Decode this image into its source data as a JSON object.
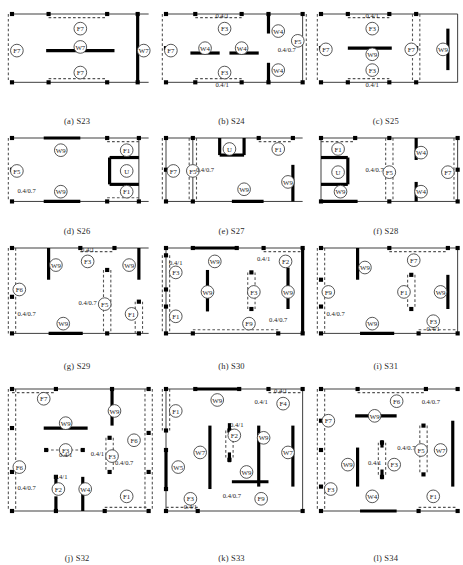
{
  "figure": {
    "type": "diagram",
    "panel_count": 12,
    "rows": 4,
    "cols": 3,
    "colors": {
      "outline": "#3a3a3a",
      "solid_wall": "#000000",
      "dashed_wall": "#555555",
      "node": "#000000",
      "label_text": "#1a1a1a"
    }
  },
  "panels": [
    {
      "id": "S23",
      "caption": "(a) S23",
      "plan": {
        "w": 112,
        "h": 56
      },
      "labels": [
        {
          "text": "F7",
          "x": 56,
          "y": 12,
          "shape": "circle"
        },
        {
          "text": "W7",
          "x": 56,
          "y": 27,
          "shape": "circle"
        },
        {
          "text": "F7",
          "x": 56,
          "y": 48,
          "shape": "circle"
        },
        {
          "text": "F7",
          "x": 4,
          "y": 30,
          "shape": "circle"
        },
        {
          "text": "W7",
          "x": 108,
          "y": 30,
          "shape": "circle"
        }
      ],
      "dims": []
    },
    {
      "id": "S24",
      "caption": "(b) S24",
      "plan": {
        "w": 112,
        "h": 56
      },
      "labels": [
        {
          "text": "F3",
          "x": 48,
          "y": 12,
          "shape": "circle"
        },
        {
          "text": "F3",
          "x": 48,
          "y": 48,
          "shape": "circle"
        },
        {
          "text": "W4",
          "x": 32,
          "y": 28,
          "shape": "circle"
        },
        {
          "text": "W4",
          "x": 62,
          "y": 28,
          "shape": "circle"
        },
        {
          "text": "F7",
          "x": 4,
          "y": 30,
          "shape": "circle"
        },
        {
          "text": "W4",
          "x": 92,
          "y": 14,
          "shape": "circle"
        },
        {
          "text": "W4",
          "x": 92,
          "y": 46,
          "shape": "circle"
        },
        {
          "text": "F5",
          "x": 108,
          "y": 22,
          "shape": "circle"
        }
      ],
      "dims": [
        {
          "text": "0.4/1",
          "x": 46,
          "y": 3
        },
        {
          "text": "0.4/1",
          "x": 46,
          "y": 60
        },
        {
          "text": "0.4/0.7",
          "x": 99,
          "y": 31
        }
      ]
    },
    {
      "id": "S25",
      "caption": "(c) S25",
      "plan": {
        "w": 112,
        "h": 56
      },
      "labels": [
        {
          "text": "F3",
          "x": 42,
          "y": 12,
          "shape": "circle"
        },
        {
          "text": "W9",
          "x": 42,
          "y": 33,
          "shape": "circle"
        },
        {
          "text": "F3",
          "x": 42,
          "y": 46,
          "shape": "circle"
        },
        {
          "text": "F7",
          "x": 4,
          "y": 29,
          "shape": "circle"
        },
        {
          "text": "F7",
          "x": 74,
          "y": 29,
          "shape": "circle"
        },
        {
          "text": "W9",
          "x": 100,
          "y": 29,
          "shape": "circle"
        }
      ],
      "dims": [
        {
          "text": "0.4/1",
          "x": 42,
          "y": 3
        },
        {
          "text": "0.4/1",
          "x": 42,
          "y": 60
        }
      ]
    },
    {
      "id": "S26",
      "caption": "(d) S26",
      "plan": {
        "w": 112,
        "h": 52
      },
      "labels": [
        {
          "text": "W9",
          "x": 40,
          "y": 10,
          "shape": "circle"
        },
        {
          "text": "W9",
          "x": 40,
          "y": 44,
          "shape": "circle"
        },
        {
          "text": "F5",
          "x": 4,
          "y": 27,
          "shape": "circle"
        },
        {
          "text": "F1",
          "x": 94,
          "y": 10,
          "shape": "circle"
        },
        {
          "text": "F1",
          "x": 94,
          "y": 44,
          "shape": "circle"
        },
        {
          "text": "U",
          "x": 94,
          "y": 27,
          "shape": "circle"
        }
      ],
      "dims": [
        {
          "text": "0.4/0.7",
          "x": 12,
          "y": 45
        }
      ]
    },
    {
      "id": "S27",
      "caption": "(e) S27",
      "plan": {
        "w": 112,
        "h": 52
      },
      "labels": [
        {
          "text": "F7",
          "x": 6,
          "y": 27,
          "shape": "circle"
        },
        {
          "text": "F5",
          "x": 22,
          "y": 27,
          "shape": "circle"
        },
        {
          "text": "U",
          "x": 52,
          "y": 9,
          "shape": "circle"
        },
        {
          "text": "F1",
          "x": 92,
          "y": 9,
          "shape": "circle"
        },
        {
          "text": "W9",
          "x": 64,
          "y": 42,
          "shape": "circle"
        },
        {
          "text": "W9",
          "x": 100,
          "y": 36,
          "shape": "circle"
        }
      ],
      "dims": [
        {
          "text": "0.4/0.7",
          "x": 32,
          "y": 28
        }
      ]
    },
    {
      "id": "S28",
      "caption": "(f) S28",
      "plan": {
        "w": 112,
        "h": 52
      },
      "labels": [
        {
          "text": "F1",
          "x": 14,
          "y": 9,
          "shape": "circle"
        },
        {
          "text": "U",
          "x": 14,
          "y": 28,
          "shape": "circle"
        },
        {
          "text": "W9",
          "x": 16,
          "y": 44,
          "shape": "circle"
        },
        {
          "text": "F5",
          "x": 56,
          "y": 28,
          "shape": "circle"
        },
        {
          "text": "W4",
          "x": 82,
          "y": 12,
          "shape": "circle"
        },
        {
          "text": "W4",
          "x": 82,
          "y": 44,
          "shape": "circle"
        },
        {
          "text": "F7",
          "x": 104,
          "y": 28,
          "shape": "circle"
        }
      ],
      "dims": [
        {
          "text": "0.4/0.7",
          "x": 44,
          "y": 28
        }
      ]
    },
    {
      "id": "S29",
      "caption": "(g) S29",
      "plan": {
        "w": 112,
        "h": 70
      },
      "labels": [
        {
          "text": "W9",
          "x": 36,
          "y": 14,
          "shape": "circle"
        },
        {
          "text": "F3",
          "x": 62,
          "y": 11,
          "shape": "circle"
        },
        {
          "text": "W9",
          "x": 96,
          "y": 14,
          "shape": "circle"
        },
        {
          "text": "F6",
          "x": 6,
          "y": 34,
          "shape": "circle"
        },
        {
          "text": "F5",
          "x": 76,
          "y": 46,
          "shape": "circle"
        },
        {
          "text": "F1",
          "x": 98,
          "y": 54,
          "shape": "circle"
        },
        {
          "text": "W9",
          "x": 42,
          "y": 62,
          "shape": "circle"
        }
      ],
      "dims": [
        {
          "text": "0.4/1",
          "x": 62,
          "y": 3
        },
        {
          "text": "0.4/0.7",
          "x": 62,
          "y": 47
        },
        {
          "text": "0.4/0.7",
          "x": 12,
          "y": 56
        }
      ]
    },
    {
      "id": "S30",
      "caption": "(h) S30",
      "plan": {
        "w": 112,
        "h": 70
      },
      "labels": [
        {
          "text": "W9",
          "x": 40,
          "y": 11,
          "shape": "circle"
        },
        {
          "text": "F2",
          "x": 98,
          "y": 11,
          "shape": "circle"
        },
        {
          "text": "F3",
          "x": 8,
          "y": 20,
          "shape": "circle"
        },
        {
          "text": "W9",
          "x": 34,
          "y": 36,
          "shape": "circle"
        },
        {
          "text": "F3",
          "x": 72,
          "y": 36,
          "shape": "circle"
        },
        {
          "text": "W9",
          "x": 100,
          "y": 36,
          "shape": "circle"
        },
        {
          "text": "F1",
          "x": 8,
          "y": 56,
          "shape": "circle"
        },
        {
          "text": "F9",
          "x": 68,
          "y": 62,
          "shape": "circle"
        }
      ],
      "dims": [
        {
          "text": "0.4/1",
          "x": 8,
          "y": 14
        },
        {
          "text": "0.4/1",
          "x": 80,
          "y": 11
        },
        {
          "text": "0.4/0.7",
          "x": 92,
          "y": 61
        }
      ]
    },
    {
      "id": "S31",
      "caption": "(i) S31",
      "plan": {
        "w": 112,
        "h": 70
      },
      "labels": [
        {
          "text": "W9",
          "x": 36,
          "y": 16,
          "shape": "circle"
        },
        {
          "text": "F7",
          "x": 76,
          "y": 10,
          "shape": "circle"
        },
        {
          "text": "F9",
          "x": 6,
          "y": 36,
          "shape": "circle"
        },
        {
          "text": "F1",
          "x": 68,
          "y": 36,
          "shape": "circle"
        },
        {
          "text": "W9",
          "x": 98,
          "y": 36,
          "shape": "circle"
        },
        {
          "text": "W9",
          "x": 42,
          "y": 62,
          "shape": "circle"
        },
        {
          "text": "F3",
          "x": 92,
          "y": 60,
          "shape": "circle"
        }
      ],
      "dims": [
        {
          "text": "0.4/0.7",
          "x": 12,
          "y": 56
        },
        {
          "text": "0.4/1",
          "x": 92,
          "y": 68
        }
      ]
    },
    {
      "id": "S32",
      "caption": "(j) S32",
      "plan": {
        "w": 112,
        "h": 100
      },
      "labels": [
        {
          "text": "F7",
          "x": 26,
          "y": 8,
          "shape": "circle"
        },
        {
          "text": "W9",
          "x": 44,
          "y": 28,
          "shape": "circle"
        },
        {
          "text": "W9",
          "x": 84,
          "y": 18,
          "shape": "circle"
        },
        {
          "text": "F6",
          "x": 100,
          "y": 42,
          "shape": "circle"
        },
        {
          "text": "F3",
          "x": 44,
          "y": 50,
          "shape": "circle"
        },
        {
          "text": "F3",
          "x": 82,
          "y": 55,
          "shape": "circle"
        },
        {
          "text": "F6",
          "x": 6,
          "y": 64,
          "shape": "circle"
        },
        {
          "text": "F2",
          "x": 38,
          "y": 82,
          "shape": "circle"
        },
        {
          "text": "W4",
          "x": 60,
          "y": 82,
          "shape": "circle"
        },
        {
          "text": "F1",
          "x": 94,
          "y": 88,
          "shape": "circle"
        }
      ],
      "dims": [
        {
          "text": "0.4/1",
          "x": 44,
          "y": 56
        },
        {
          "text": "0.4/1",
          "x": 70,
          "y": 55
        },
        {
          "text": "0.4/0.7",
          "x": 92,
          "y": 62
        },
        {
          "text": "0.4/1",
          "x": 40,
          "y": 74
        },
        {
          "text": "0.4/0.7",
          "x": 12,
          "y": 83
        }
      ]
    },
    {
      "id": "S33",
      "caption": "(k) S33",
      "plan": {
        "w": 112,
        "h": 100
      },
      "labels": [
        {
          "text": "W9",
          "x": 42,
          "y": 9,
          "shape": "circle"
        },
        {
          "text": "F4",
          "x": 96,
          "y": 12,
          "shape": "circle"
        },
        {
          "text": "F1",
          "x": 8,
          "y": 18,
          "shape": "circle"
        },
        {
          "text": "F2",
          "x": 56,
          "y": 38,
          "shape": "circle"
        },
        {
          "text": "W7",
          "x": 28,
          "y": 52,
          "shape": "circle"
        },
        {
          "text": "W9",
          "x": 80,
          "y": 40,
          "shape": "circle"
        },
        {
          "text": "W7",
          "x": 100,
          "y": 52,
          "shape": "circle"
        },
        {
          "text": "W5",
          "x": 10,
          "y": 64,
          "shape": "circle"
        },
        {
          "text": "W9",
          "x": 66,
          "y": 68,
          "shape": "circle"
        },
        {
          "text": "F3",
          "x": 20,
          "y": 90,
          "shape": "circle"
        },
        {
          "text": "F9",
          "x": 78,
          "y": 90,
          "shape": "circle"
        }
      ],
      "dims": [
        {
          "text": "0.4/1",
          "x": 94,
          "y": 3
        },
        {
          "text": "0.4/1",
          "x": 78,
          "y": 12
        },
        {
          "text": "0.4/1",
          "x": 58,
          "y": 31
        },
        {
          "text": "0.4/0.7",
          "x": 54,
          "y": 89
        },
        {
          "text": "0.4/1",
          "x": 20,
          "y": 98
        }
      ]
    },
    {
      "id": "S34",
      "caption": "(l) S34",
      "plan": {
        "w": 112,
        "h": 100
      },
      "labels": [
        {
          "text": "F6",
          "x": 62,
          "y": 10,
          "shape": "circle"
        },
        {
          "text": "F7",
          "x": 6,
          "y": 26,
          "shape": "circle"
        },
        {
          "text": "W9",
          "x": 44,
          "y": 22,
          "shape": "circle"
        },
        {
          "text": "F5",
          "x": 82,
          "y": 50,
          "shape": "circle"
        },
        {
          "text": "W7",
          "x": 98,
          "y": 50,
          "shape": "circle"
        },
        {
          "text": "W9",
          "x": 22,
          "y": 62,
          "shape": "circle"
        },
        {
          "text": "F3",
          "x": 60,
          "y": 62,
          "shape": "circle"
        },
        {
          "text": "F3",
          "x": 8,
          "y": 82,
          "shape": "circle"
        },
        {
          "text": "W4",
          "x": 42,
          "y": 88,
          "shape": "circle"
        },
        {
          "text": "F1",
          "x": 92,
          "y": 88,
          "shape": "circle"
        }
      ],
      "dims": [
        {
          "text": "0.4/0.7",
          "x": 90,
          "y": 12
        },
        {
          "text": "0.4/0.7",
          "x": 70,
          "y": 50
        },
        {
          "text": "0.4/1",
          "x": 44,
          "y": 62
        }
      ]
    }
  ],
  "dimension_values": [
    "0.4/1",
    "0.4/0.7"
  ],
  "element_tags": [
    "F1",
    "F2",
    "F3",
    "F4",
    "F5",
    "F6",
    "F7",
    "F9",
    "W4",
    "W5",
    "W7",
    "W9",
    "U"
  ]
}
